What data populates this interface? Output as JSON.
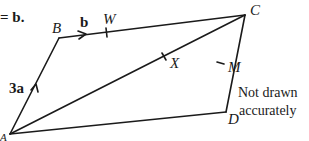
{
  "header_fragment": "= b.",
  "diagram": {
    "shape": "parallelogram",
    "vertices": {
      "A": {
        "label": "A",
        "x": 10,
        "y": 134
      },
      "B": {
        "label": "B",
        "x": 59,
        "y": 38
      },
      "C": {
        "label": "C",
        "x": 245,
        "y": 15
      },
      "D": {
        "label": "D",
        "x": 226,
        "y": 112
      }
    },
    "points": {
      "W": {
        "label": "W",
        "on": "BC"
      },
      "X": {
        "label": "X",
        "on": "AC"
      },
      "M": {
        "label": "M",
        "on": "CD"
      }
    },
    "vectors": {
      "AB": {
        "label": "3a"
      },
      "BC": {
        "label": "b"
      }
    },
    "note_line1": "Not drawn",
    "note_line2": "accurately",
    "stroke_color": "#1a1a1a"
  }
}
